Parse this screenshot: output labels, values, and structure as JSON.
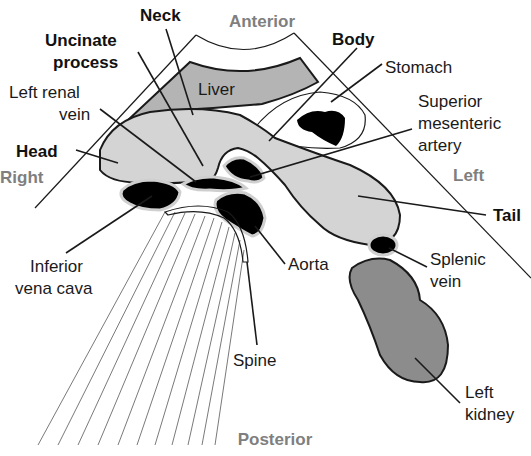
{
  "diagram": {
    "orientation": {
      "anterior": "Anterior",
      "posterior": "Posterior",
      "right": "Right",
      "left": "Left"
    },
    "labels": {
      "neck": "Neck",
      "uncinate_line1": "Uncinate",
      "uncinate_line2": "process",
      "left_renal_vein_line1": "Left renal",
      "left_renal_vein_line2": "vein",
      "head": "Head",
      "liver": "Liver",
      "body": "Body",
      "stomach": "Stomach",
      "sma_line1": "Superior",
      "sma_line2": "mesenteric",
      "sma_line3": "artery",
      "tail": "Tail",
      "ivc_line1": "Inferior",
      "ivc_line2": "vena cava",
      "aorta": "Aorta",
      "splenic_vein_line1": "Splenic",
      "splenic_vein_line2": "vein",
      "spine": "Spine",
      "left_kidney_line1": "Left",
      "left_kidney_line2": "kidney"
    },
    "colors": {
      "pancreas": "#d4d4d4",
      "liver": "#b4b4b4",
      "kidney": "#8c8c8c",
      "vessel": "#000000",
      "vessel_rim": "#cfcfcf",
      "direction_text": "#7f7f7f",
      "label_text": "#1a1a1a"
    }
  }
}
